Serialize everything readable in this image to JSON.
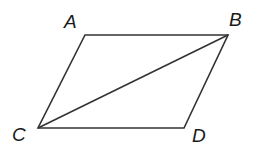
{
  "figure": {
    "type": "parallelogram-with-diagonal",
    "vertices": [
      {
        "label": "A",
        "x": 85,
        "y": 35
      },
      {
        "label": "B",
        "x": 228,
        "y": 35
      },
      {
        "label": "D",
        "x": 184,
        "y": 128
      },
      {
        "label": "C",
        "x": 38,
        "y": 128
      }
    ],
    "diagonal": [
      "C",
      "B"
    ],
    "labels": {
      "A": "A",
      "B": "B",
      "C": "C",
      "D": "D"
    },
    "stroke_color": "#333333"
  }
}
